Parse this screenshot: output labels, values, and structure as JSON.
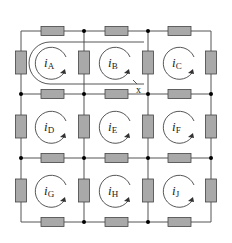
{
  "diagram": {
    "type": "resistor mesh circuit",
    "grid": {
      "cols": 3,
      "rows": 3
    },
    "mesh_currents": [
      {
        "id": "A",
        "symbol": "i",
        "subscript": "A",
        "direction": "clockwise"
      },
      {
        "id": "B",
        "symbol": "i",
        "subscript": "B",
        "direction": "clockwise"
      },
      {
        "id": "C",
        "symbol": "i",
        "subscript": "C",
        "direction": "clockwise"
      },
      {
        "id": "D",
        "symbol": "i",
        "subscript": "D",
        "direction": "clockwise"
      },
      {
        "id": "E",
        "symbol": "i",
        "subscript": "E",
        "direction": "clockwise"
      },
      {
        "id": "F",
        "symbol": "i",
        "subscript": "F",
        "direction": "clockwise"
      },
      {
        "id": "G",
        "symbol": "i",
        "subscript": "G",
        "direction": "clockwise"
      },
      {
        "id": "H",
        "symbol": "i",
        "subscript": "H",
        "direction": "clockwise"
      },
      {
        "id": "J",
        "symbol": "i",
        "subscript": "J",
        "direction": "clockwise"
      }
    ],
    "supermesh_label": "x",
    "supermesh_encloses": [
      "A",
      "B"
    ],
    "colors": {
      "resistor_fill": "#a9a9a9",
      "wire": "#555555",
      "node": "#000000"
    }
  }
}
